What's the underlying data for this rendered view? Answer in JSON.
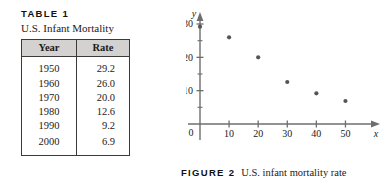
{
  "table": {
    "label": "TABLE 1",
    "subtitle": "U.S. Infant Mortality",
    "columns": [
      "Year",
      "Rate"
    ],
    "rows": [
      {
        "year": "1950",
        "rate": "29.2"
      },
      {
        "year": "1960",
        "rate": "26.0"
      },
      {
        "year": "1970",
        "rate": "20.0"
      },
      {
        "year": "1980",
        "rate": "12.6"
      },
      {
        "year": "1990",
        "rate": "9.2"
      },
      {
        "year": "2000",
        "rate": "6.9"
      }
    ]
  },
  "figure": {
    "label": "FIGURE 2",
    "caption": "U.S. infant mortality rate"
  },
  "chart_data": {
    "type": "scatter",
    "title": "",
    "xlabel": "x",
    "ylabel": "y",
    "xlim": [
      0,
      55
    ],
    "ylim": [
      0,
      33
    ],
    "xticks": [
      10,
      20,
      30,
      40,
      50
    ],
    "xtick_labels": [
      "10",
      "20",
      "30",
      "40",
      "50"
    ],
    "yticks": [
      10,
      20,
      30
    ],
    "ytick_labels": [
      "10",
      "20",
      "30"
    ],
    "y_minor_ticks": [
      5,
      15,
      25
    ],
    "origin_label": "0",
    "grid": false,
    "legend": false,
    "axis_arrows": true,
    "marker_color": "#555555",
    "x": [
      0,
      10,
      20,
      30,
      40,
      50
    ],
    "y": [
      29.2,
      26.0,
      20.0,
      12.6,
      9.2,
      6.9
    ],
    "points": [
      {
        "x": 0,
        "y": 29.2
      },
      {
        "x": 10,
        "y": 26.0
      },
      {
        "x": 20,
        "y": 20.0
      },
      {
        "x": 30,
        "y": 12.6
      },
      {
        "x": 40,
        "y": 9.2
      },
      {
        "x": 50,
        "y": 6.9
      }
    ]
  }
}
